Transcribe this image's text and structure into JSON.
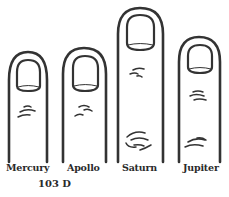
{
  "figure": {
    "caption": "103 D",
    "colors": {
      "ink": "#333333",
      "background": "#ffffff"
    },
    "fingers": [
      {
        "name": "Mercury",
        "label": "Mercury"
      },
      {
        "name": "Apollo",
        "label": "Apollo"
      },
      {
        "name": "Saturn",
        "label": "Saturn"
      },
      {
        "name": "Jupiter",
        "label": "Jupiter"
      }
    ]
  }
}
